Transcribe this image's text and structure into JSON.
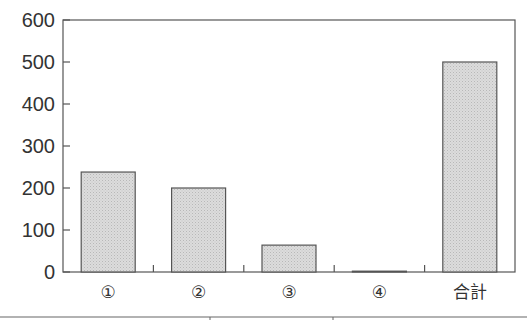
{
  "chart_data": {
    "type": "bar",
    "title": "",
    "xlabel": "",
    "ylabel": "",
    "categories": [
      "①",
      "②",
      "③",
      "④",
      "合計"
    ],
    "values": [
      238,
      200,
      64,
      2,
      500
    ],
    "ylim": [
      0,
      600
    ],
    "yticks": [
      0,
      100,
      200,
      300,
      400,
      500,
      600
    ],
    "grid": false,
    "legend": null,
    "bar_fill": "#d9d9d9",
    "bar_stroke": "#555555",
    "axis_color": "#555555"
  }
}
